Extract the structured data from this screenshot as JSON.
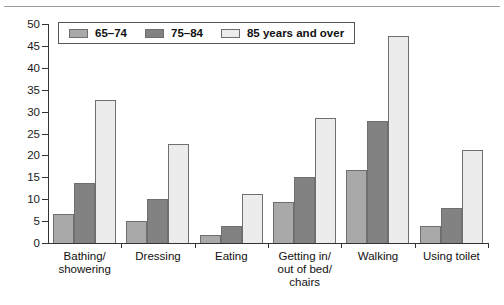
{
  "chart_data": {
    "type": "bar",
    "title": "",
    "subtitle": "",
    "xlabel": "",
    "ylabel": "",
    "ylim": [
      0,
      50
    ],
    "yticks": [
      0,
      5,
      10,
      15,
      20,
      25,
      30,
      35,
      40,
      45,
      50
    ],
    "ytick_labels": [
      "0",
      "5",
      "10",
      "15",
      "20",
      "25",
      "30",
      "35",
      "40",
      "45",
      "50"
    ],
    "grid": false,
    "legend_position": "top-left-inside",
    "categories": [
      "Bathing/\nshowering",
      "Dressing",
      "Eating",
      "Getting in/\nout of bed/\nchairs",
      "Walking",
      "Using toilet"
    ],
    "series": [
      {
        "name": "65–74",
        "color": "#a9a9a9",
        "values": [
          6.7,
          5.1,
          1.9,
          9.4,
          16.7,
          3.9
        ]
      },
      {
        "name": "75–84",
        "color": "#828282",
        "values": [
          13.8,
          10.0,
          3.9,
          15.0,
          27.8,
          8.0
        ]
      },
      {
        "name": "85 years and over",
        "color": "#ececec",
        "values": [
          32.7,
          22.6,
          11.2,
          28.5,
          47.3,
          21.2
        ]
      }
    ]
  },
  "legend": {
    "items": [
      {
        "label": "65–74"
      },
      {
        "label": "75–84"
      },
      {
        "label": "85 years and over"
      }
    ]
  },
  "axis": {
    "y_labels": [
      "50",
      "45",
      "40",
      "35",
      "30",
      "25",
      "20",
      "15",
      "10",
      "5",
      "0"
    ]
  },
  "colors": {
    "series_65_74": "#a9a9a9",
    "series_75_84": "#828282",
    "series_85_over": "#ececec",
    "axis": "#333333",
    "bar_outline": "#6f6f6f",
    "background": "#ffffff"
  }
}
